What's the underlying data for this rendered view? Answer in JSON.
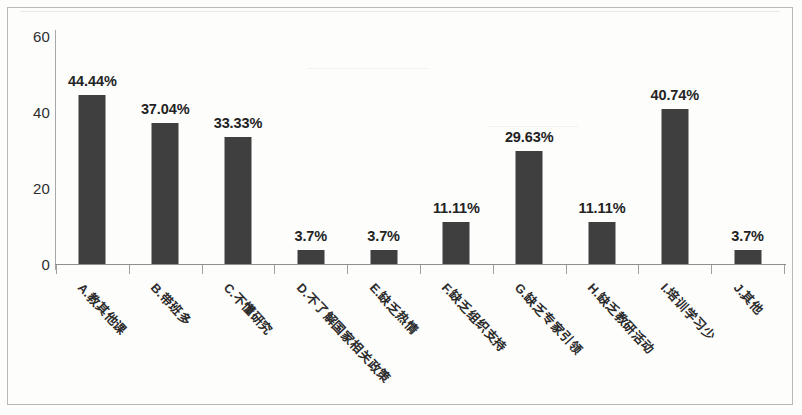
{
  "chart_data": {
    "type": "bar",
    "title": "",
    "subtitle": "",
    "xlabel": "",
    "ylabel": "",
    "categories": [
      "A.教其他课",
      "B.带班多",
      "C.不懂研究",
      "D.不了解国家相关政策",
      "E.缺乏热情",
      "F.缺乏组织支持",
      "G.缺乏专家引领",
      "H.缺乏教研活动",
      "I.培训学习少",
      "J.其他"
    ],
    "values": [
      44.44,
      37.04,
      33.33,
      3.7,
      3.7,
      11.11,
      29.63,
      11.11,
      40.74,
      3.7
    ],
    "data_labels": [
      "44.44%",
      "37.04%",
      "33.33%",
      "3.7%",
      "3.7%",
      "11.11%",
      "29.63%",
      "11.11%",
      "40.74%",
      "3.7%"
    ],
    "ylim": [
      0,
      60
    ],
    "yticks": [
      0,
      20,
      40,
      60
    ],
    "ytick_labels": [
      "0",
      "20",
      "40",
      "60"
    ],
    "grid": false,
    "legend": false,
    "legend_position": "none",
    "series": [
      {
        "name": "占比",
        "values": [
          44.44,
          37.04,
          33.33,
          3.7,
          3.7,
          11.11,
          29.63,
          11.11,
          40.74,
          3.7
        ]
      }
    ]
  },
  "style": {
    "bar_color": "#3f3f3f",
    "axis_color": "#8f8f8f",
    "text_color": "#232323",
    "background": "#fdfdfc",
    "border_color": "#b9b9b9"
  }
}
